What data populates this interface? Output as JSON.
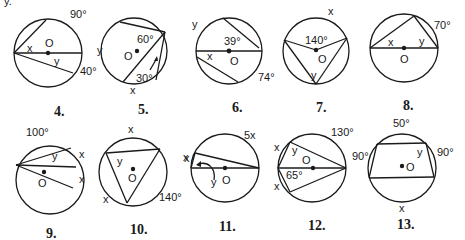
{
  "header_fragment": "y.",
  "problems": [
    {
      "number": "4.",
      "labels": {
        "arc_top": "90°",
        "arc_right": "40°",
        "center": "O",
        "angle_x": "x",
        "angle_y": "y"
      }
    },
    {
      "number": "5.",
      "labels": {
        "angle_top": "60°",
        "angle_bottom": "30°",
        "center": "O",
        "arc_left": "y",
        "arc_bottom": "x"
      }
    },
    {
      "number": "6.",
      "labels": {
        "angle": "39°",
        "arc_bottom_right": "74°",
        "center": "O",
        "arc_top_left": "y",
        "angle_x": "x"
      }
    },
    {
      "number": "7.",
      "labels": {
        "central_angle": "140°",
        "center": "O",
        "arc_top": "x",
        "angle_y": "y"
      }
    },
    {
      "number": "8.",
      "labels": {
        "arc": "70°",
        "center": "O",
        "angle_x": "x",
        "angle_y": "y"
      }
    },
    {
      "number": "9.",
      "labels": {
        "arc_top": "100°",
        "center": "O",
        "arc_x1": "x",
        "arc_x2": "x",
        "angle_y": "y"
      }
    },
    {
      "number": "10.",
      "labels": {
        "arc_top": "x",
        "arc_right": "x",
        "arc_left": "x",
        "arc_bottom_right": "140°",
        "center": "O",
        "angle_y": "y"
      }
    },
    {
      "number": "11.",
      "labels": {
        "arc_top": "5x",
        "arc_left": "x",
        "angle_y": "y",
        "center": "O"
      }
    },
    {
      "number": "12.",
      "labels": {
        "arc_top": "130°",
        "angle": "65°",
        "center": "O",
        "arc_x1": "x",
        "arc_x2": "x",
        "angle_y": "y"
      }
    },
    {
      "number": "13.",
      "labels": {
        "arc_top": "50°",
        "arc_left": "90°",
        "arc_right": "90°",
        "arc_bottom": "x",
        "center": "O",
        "angle_y": "y"
      }
    }
  ]
}
